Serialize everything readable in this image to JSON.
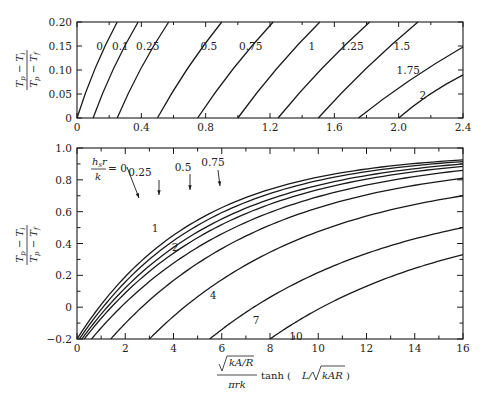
{
  "chart_data": [
    {
      "type": "line",
      "title": "",
      "xlabel": "",
      "ylabel": "(T_p - T_i) / (T_p - T_f)",
      "xlim": [
        0,
        2.4
      ],
      "ylim": [
        0,
        0.2
      ],
      "x_ticks": [
        "0",
        "0.4",
        "0.8",
        "1.2",
        "1.6",
        "2.0",
        "2.4"
      ],
      "y_ticks": [
        "0",
        "0.05",
        "0.10",
        "0.15",
        "0.20"
      ],
      "grid": false,
      "series": [
        {
          "name": "0",
          "label": "0",
          "points": [
            [
              0.0,
              0.0
            ],
            [
              0.25,
              0.2
            ]
          ]
        },
        {
          "name": "0.1",
          "label": "0.1",
          "points": [
            [
              0.1,
              0.0
            ],
            [
              0.38,
              0.2
            ]
          ]
        },
        {
          "name": "0.25",
          "label": "0.25",
          "points": [
            [
              0.25,
              0.0
            ],
            [
              0.57,
              0.2
            ]
          ]
        },
        {
          "name": "0.5",
          "label": "0.5",
          "points": [
            [
              0.5,
              0.0
            ],
            [
              0.9,
              0.2
            ]
          ]
        },
        {
          "name": "0.75",
          "label": "0.75",
          "points": [
            [
              0.75,
              0.0
            ],
            [
              1.22,
              0.2
            ]
          ]
        },
        {
          "name": "1",
          "label": "1",
          "points": [
            [
              1.0,
              0.0
            ],
            [
              1.51,
              0.2
            ]
          ]
        },
        {
          "name": "1.25",
          "label": "1.25",
          "points": [
            [
              1.25,
              0.0
            ],
            [
              1.82,
              0.2
            ]
          ]
        },
        {
          "name": "1.5",
          "label": "1.5",
          "points": [
            [
              1.5,
              0.0
            ],
            [
              2.12,
              0.2
            ]
          ]
        },
        {
          "name": "1.75",
          "label": "1.75",
          "points": [
            [
              1.75,
              0.0
            ],
            [
              2.4,
              0.148
            ]
          ]
        },
        {
          "name": "2",
          "label": "2",
          "points": [
            [
              2.0,
              0.0
            ],
            [
              2.4,
              0.09
            ]
          ]
        }
      ]
    },
    {
      "type": "line",
      "title": "",
      "xlabel": "√(kA/R) / (πrk) · tanh(L/√(kAR))",
      "ylabel": "(T_p - T_i) / (T_p - T_f)",
      "xlim": [
        0,
        16
      ],
      "ylim": [
        -0.2,
        1.0
      ],
      "x_ticks": [
        "0",
        "2",
        "4",
        "6",
        "8",
        "10",
        "12",
        "14",
        "16"
      ],
      "y_ticks": [
        "-0.2",
        "0",
        "0.2",
        "0.4",
        "0.6",
        "0.8",
        "1.0"
      ],
      "grid": false,
      "legend_parameter": "h_s r / k",
      "series": [
        {
          "name": "0",
          "label": "0",
          "x0": 0.0,
          "y_end": 0.925
        },
        {
          "name": "0.25",
          "label": "0.25",
          "x0": 0.1,
          "y_end": 0.915
        },
        {
          "name": "0.5",
          "label": "0.5",
          "x0": 0.2,
          "y_end": 0.9
        },
        {
          "name": "0.75",
          "label": "0.75",
          "x0": 0.3,
          "y_end": 0.885
        },
        {
          "name": "1",
          "label": "1",
          "x0": 0.6,
          "y_end": 0.86
        },
        {
          "name": "2",
          "label": "2",
          "x0": 1.4,
          "y_end": 0.81
        },
        {
          "name": "4",
          "label": "4",
          "x0": 3.0,
          "y_end": 0.7
        },
        {
          "name": "7",
          "label": "7",
          "x0": 5.5,
          "y_end": 0.5
        },
        {
          "name": "10",
          "label": "10",
          "x0": 8.0,
          "y_end": 0.33
        }
      ]
    }
  ],
  "labels": {
    "top_ylabel_num": "T",
    "top_ylabel_num_sub1": "p",
    "top_ylabel_minus": "−",
    "top_ylabel_num_T2": "T",
    "top_ylabel_num_sub2": "i",
    "top_ylabel_den_sub2": "f",
    "legend_h": "h",
    "legend_h_sub": "s",
    "legend_r": "r",
    "legend_k": "k",
    "legend_eq": "= 0",
    "xlabel_sqrt_inner": "kA/R",
    "xlabel_den": "πrk",
    "xlabel_tanh": "tanh (",
    "xlabel_L": "L/",
    "xlabel_sqrt2_inner": "kAR",
    "xlabel_close": ")"
  }
}
